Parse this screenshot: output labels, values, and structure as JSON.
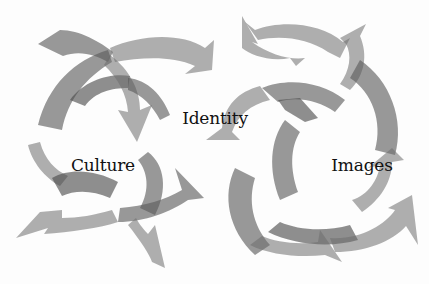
{
  "diagram": {
    "labels": [
      {
        "id": "identity",
        "text": "Identity",
        "x": 215,
        "y": 118
      },
      {
        "id": "culture",
        "text": "Culture",
        "x": 103,
        "y": 165
      },
      {
        "id": "images",
        "text": "Images",
        "x": 362,
        "y": 165
      }
    ],
    "arrow_color": "#5a5a5a",
    "background_color": "#fdfdfd",
    "text_color": "#111111",
    "clusters": [
      {
        "name": "left-arrow-cluster",
        "arrow_count": 9
      },
      {
        "name": "right-arrow-cluster",
        "arrow_count": 8
      }
    ]
  }
}
